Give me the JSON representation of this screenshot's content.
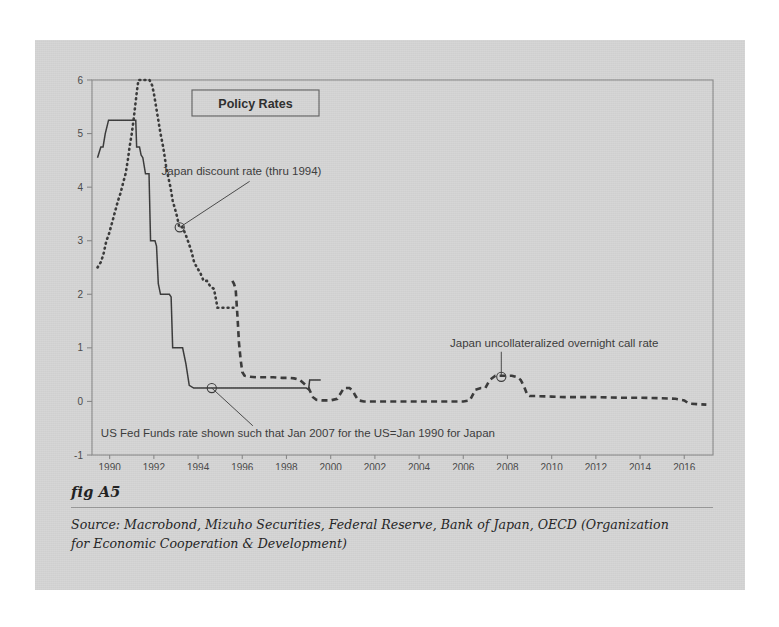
{
  "figure": {
    "label": "fig A5",
    "source": "Source:  Macrobond, Mizuho Securities, Federal Reserve, Bank of Japan, OECD (Organization for Economic Cooperation & Development)"
  },
  "colors": {
    "panel_background": "#d6d6d6",
    "page_background": "#ffffff",
    "series_line": "#3a3a3a",
    "axis": "#8a8a8a",
    "text": "#333333"
  },
  "chart_data": {
    "type": "line",
    "title": "Policy Rates",
    "xlabel": "",
    "ylabel": "",
    "xlim": [
      1989.2,
      2017.3
    ],
    "ylim": [
      -1,
      6
    ],
    "yticks": [
      -1,
      0,
      1,
      2,
      3,
      4,
      5,
      6
    ],
    "ytick_labels": [
      "-1",
      "0",
      "1",
      "2",
      "3",
      "4",
      "5",
      "6"
    ],
    "xticks": [
      1990,
      1992,
      1994,
      1996,
      1998,
      2000,
      2002,
      2004,
      2006,
      2008,
      2010,
      2012,
      2014,
      2016
    ],
    "xtick_labels": [
      "1990",
      "1992",
      "1994",
      "1996",
      "1998",
      "2000",
      "2002",
      "2004",
      "2006",
      "2008",
      "2010",
      "2012",
      "2014",
      "2016"
    ],
    "grid": false,
    "legend_position": "none",
    "series": [
      {
        "name": "US Fed Funds rate (shifted)",
        "style": "solid",
        "points": [
          [
            1989.45,
            4.55
          ],
          [
            1989.6,
            4.75
          ],
          [
            1989.7,
            4.75
          ],
          [
            1989.8,
            5.0
          ],
          [
            1989.95,
            5.25
          ],
          [
            1990.15,
            5.25
          ],
          [
            1990.8,
            5.25
          ],
          [
            1991.05,
            5.25
          ],
          [
            1991.18,
            5.25
          ],
          [
            1991.22,
            4.75
          ],
          [
            1991.35,
            4.75
          ],
          [
            1991.42,
            4.6
          ],
          [
            1991.5,
            4.55
          ],
          [
            1991.62,
            4.25
          ],
          [
            1991.78,
            4.25
          ],
          [
            1991.85,
            3.0
          ],
          [
            1992.05,
            3.0
          ],
          [
            1992.12,
            2.9
          ],
          [
            1992.2,
            2.2
          ],
          [
            1992.3,
            2.0
          ],
          [
            1992.55,
            2.0
          ],
          [
            1992.62,
            2.0
          ],
          [
            1992.7,
            2.0
          ],
          [
            1992.78,
            1.95
          ],
          [
            1992.85,
            1.0
          ],
          [
            1993.3,
            1.0
          ],
          [
            1993.45,
            0.7
          ],
          [
            1993.6,
            0.3
          ],
          [
            1993.8,
            0.25
          ],
          [
            1994.5,
            0.25
          ],
          [
            1996.0,
            0.25
          ],
          [
            1998.0,
            0.25
          ],
          [
            1998.9,
            0.25
          ],
          [
            1999.0,
            0.22
          ],
          [
            1999.05,
            0.4
          ],
          [
            1999.35,
            0.4
          ],
          [
            1999.55,
            0.4
          ]
        ]
      },
      {
        "name": "Japan discount rate (thru 1994)",
        "style": "dotted",
        "points": [
          [
            1989.45,
            2.5
          ],
          [
            1989.6,
            2.6
          ],
          [
            1989.72,
            2.75
          ],
          [
            1989.85,
            3.0
          ],
          [
            1989.95,
            3.1
          ],
          [
            1990.05,
            3.25
          ],
          [
            1990.15,
            3.4
          ],
          [
            1990.28,
            3.6
          ],
          [
            1990.38,
            3.75
          ],
          [
            1990.5,
            3.9
          ],
          [
            1990.62,
            4.1
          ],
          [
            1990.72,
            4.25
          ],
          [
            1990.82,
            4.5
          ],
          [
            1990.9,
            4.75
          ],
          [
            1991.0,
            5.0
          ],
          [
            1991.08,
            5.25
          ],
          [
            1991.15,
            5.5
          ],
          [
            1991.22,
            5.75
          ],
          [
            1991.3,
            6.0
          ],
          [
            1991.5,
            6.0
          ],
          [
            1991.65,
            6.0
          ],
          [
            1991.8,
            6.0
          ],
          [
            1991.92,
            5.9
          ],
          [
            1992.0,
            5.75
          ],
          [
            1992.1,
            5.5
          ],
          [
            1992.2,
            5.25
          ],
          [
            1992.3,
            5.0
          ],
          [
            1992.42,
            4.75
          ],
          [
            1992.55,
            4.4
          ],
          [
            1992.62,
            4.25
          ],
          [
            1992.75,
            4.0
          ],
          [
            1992.85,
            3.75
          ],
          [
            1992.95,
            3.6
          ],
          [
            1993.05,
            3.45
          ],
          [
            1993.15,
            3.25
          ],
          [
            1993.3,
            3.25
          ],
          [
            1993.45,
            3.1
          ],
          [
            1993.58,
            2.95
          ],
          [
            1993.7,
            2.8
          ],
          [
            1993.82,
            2.6
          ],
          [
            1993.95,
            2.5
          ],
          [
            1994.1,
            2.4
          ],
          [
            1994.25,
            2.25
          ],
          [
            1994.4,
            2.25
          ],
          [
            1994.55,
            2.15
          ],
          [
            1994.72,
            2.1
          ],
          [
            1994.88,
            1.75
          ],
          [
            1995.15,
            1.75
          ],
          [
            1995.4,
            1.75
          ],
          [
            1995.6,
            1.75
          ]
        ]
      },
      {
        "name": "Japan uncollateralized overnight call rate",
        "style": "dashed",
        "points": [
          [
            1995.55,
            2.25
          ],
          [
            1995.62,
            2.2
          ],
          [
            1995.7,
            2.1
          ],
          [
            1995.78,
            1.6
          ],
          [
            1995.85,
            1.1
          ],
          [
            1995.92,
            0.8
          ],
          [
            1996.0,
            0.55
          ],
          [
            1996.1,
            0.48
          ],
          [
            1996.35,
            0.46
          ],
          [
            1996.7,
            0.45
          ],
          [
            1997.0,
            0.45
          ],
          [
            1997.4,
            0.45
          ],
          [
            1997.8,
            0.44
          ],
          [
            1998.1,
            0.44
          ],
          [
            1998.35,
            0.43
          ],
          [
            1998.6,
            0.4
          ],
          [
            1998.8,
            0.33
          ],
          [
            1999.0,
            0.25
          ],
          [
            1999.2,
            0.08
          ],
          [
            1999.35,
            0.03
          ],
          [
            1999.6,
            0.02
          ],
          [
            2000.0,
            0.02
          ],
          [
            2000.3,
            0.05
          ],
          [
            2000.6,
            0.25
          ],
          [
            2000.85,
            0.25
          ],
          [
            2001.0,
            0.2
          ],
          [
            2001.1,
            0.12
          ],
          [
            2001.25,
            0.02
          ],
          [
            2001.5,
            0.0
          ],
          [
            2002.0,
            0.0
          ],
          [
            2002.5,
            0.0
          ],
          [
            2003.0,
            0.0
          ],
          [
            2003.5,
            0.0
          ],
          [
            2004.0,
            0.0
          ],
          [
            2004.5,
            0.0
          ],
          [
            2005.0,
            0.0
          ],
          [
            2005.5,
            0.0
          ],
          [
            2006.0,
            0.0
          ],
          [
            2006.3,
            0.02
          ],
          [
            2006.55,
            0.22
          ],
          [
            2006.8,
            0.25
          ],
          [
            2007.0,
            0.25
          ],
          [
            2007.2,
            0.4
          ],
          [
            2007.45,
            0.48
          ],
          [
            2007.8,
            0.48
          ],
          [
            2008.2,
            0.48
          ],
          [
            2008.45,
            0.45
          ],
          [
            2008.6,
            0.4
          ],
          [
            2008.75,
            0.28
          ],
          [
            2008.9,
            0.12
          ],
          [
            2009.0,
            0.1
          ],
          [
            2009.3,
            0.1
          ],
          [
            2010.0,
            0.09
          ],
          [
            2010.6,
            0.08
          ],
          [
            2011.0,
            0.08
          ],
          [
            2012.0,
            0.08
          ],
          [
            2013.0,
            0.07
          ],
          [
            2014.0,
            0.07
          ],
          [
            2015.0,
            0.06
          ],
          [
            2015.6,
            0.05
          ],
          [
            2016.0,
            0.02
          ],
          [
            2016.2,
            -0.04
          ],
          [
            2016.6,
            -0.05
          ],
          [
            2017.0,
            -0.06
          ]
        ]
      }
    ],
    "annotations": [
      {
        "id": "japan-discount-rate",
        "text": "Japan discount rate (thru 1994)",
        "text_x": 1992.35,
        "text_y": 4.22,
        "marker_x": 1993.17,
        "marker_y": 3.25
      },
      {
        "id": "us-fed-funds-note",
        "text": "US Fed Funds rate shown such that Jan 2007 for the US=Jan 1990 for Japan",
        "text_x": 1989.6,
        "text_y": -0.66,
        "marker_x": 1994.62,
        "marker_y": 0.25
      },
      {
        "id": "japan-call-rate",
        "text": "Japan uncollateralized overnight call rate",
        "text_x": 2005.4,
        "text_y": 1.02,
        "marker_x": 2007.72,
        "marker_y": 0.46
      }
    ]
  }
}
